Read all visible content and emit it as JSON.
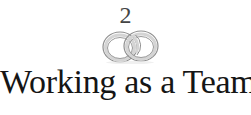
{
  "chapter": {
    "number": "2",
    "title": "Working as a Team",
    "emblem": "interlocking-rings-icon"
  },
  "colors": {
    "background": "#ffffff",
    "text": "#151515",
    "number": "#444444",
    "ring_stroke": "#9a9a9a",
    "ring_highlight": "#d8d8d8"
  }
}
